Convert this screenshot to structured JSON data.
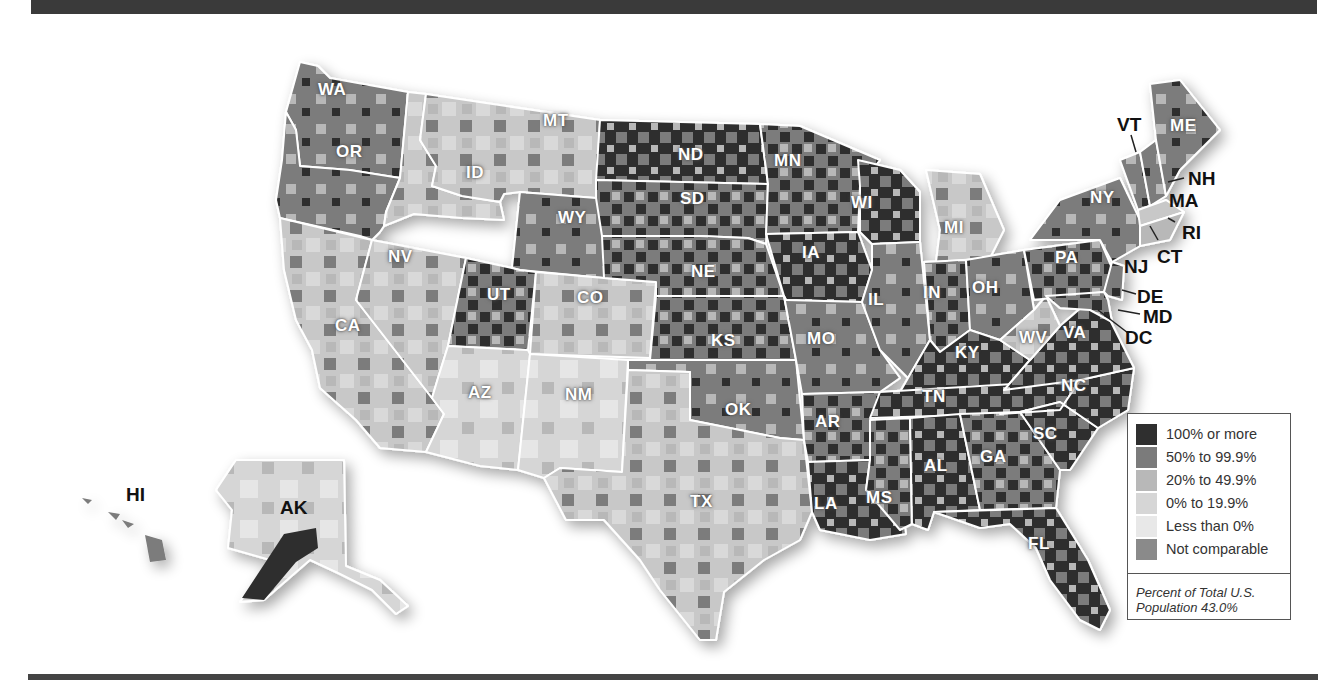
{
  "map": {
    "title": "",
    "subject": "Percent change by county (US)",
    "colors": {
      "c100": "#2f2f2f",
      "c50": "#7b7b7b",
      "c20": "#b8b8b8",
      "c0": "#d6d6d6",
      "neg": "#e8e8e8",
      "nc": "#8a8a8a",
      "border": "#ffffff"
    },
    "state_labels": [
      {
        "id": "WA",
        "text": "WA"
      },
      {
        "id": "OR",
        "text": "OR"
      },
      {
        "id": "CA",
        "text": "CA"
      },
      {
        "id": "ID",
        "text": "ID"
      },
      {
        "id": "NV",
        "text": "NV"
      },
      {
        "id": "MT",
        "text": "MT"
      },
      {
        "id": "WY",
        "text": "WY"
      },
      {
        "id": "UT",
        "text": "UT"
      },
      {
        "id": "AZ",
        "text": "AZ"
      },
      {
        "id": "CO",
        "text": "CO"
      },
      {
        "id": "NM",
        "text": "NM"
      },
      {
        "id": "ND",
        "text": "ND"
      },
      {
        "id": "SD",
        "text": "SD"
      },
      {
        "id": "NE",
        "text": "NE"
      },
      {
        "id": "KS",
        "text": "KS"
      },
      {
        "id": "OK",
        "text": "OK"
      },
      {
        "id": "TX",
        "text": "TX"
      },
      {
        "id": "MN",
        "text": "MN"
      },
      {
        "id": "IA",
        "text": "IA"
      },
      {
        "id": "MO",
        "text": "MO"
      },
      {
        "id": "AR",
        "text": "AR"
      },
      {
        "id": "LA",
        "text": "LA"
      },
      {
        "id": "WI",
        "text": "WI"
      },
      {
        "id": "IL",
        "text": "IL"
      },
      {
        "id": "MS",
        "text": "MS"
      },
      {
        "id": "MI",
        "text": "MI"
      },
      {
        "id": "IN",
        "text": "IN"
      },
      {
        "id": "KY",
        "text": "KY"
      },
      {
        "id": "TN",
        "text": "TN"
      },
      {
        "id": "AL",
        "text": "AL"
      },
      {
        "id": "OH",
        "text": "OH"
      },
      {
        "id": "WV",
        "text": "WV"
      },
      {
        "id": "GA",
        "text": "GA"
      },
      {
        "id": "FL",
        "text": "FL"
      },
      {
        "id": "SC",
        "text": "SC"
      },
      {
        "id": "NC",
        "text": "NC"
      },
      {
        "id": "VA",
        "text": "VA"
      },
      {
        "id": "PA",
        "text": "PA"
      },
      {
        "id": "NY",
        "text": "NY"
      },
      {
        "id": "ME",
        "text": "ME"
      }
    ],
    "callout_labels": [
      {
        "id": "VT",
        "text": "VT"
      },
      {
        "id": "NH",
        "text": "NH"
      },
      {
        "id": "MA",
        "text": "MA"
      },
      {
        "id": "RI",
        "text": "RI"
      },
      {
        "id": "CT",
        "text": "CT"
      },
      {
        "id": "NJ",
        "text": "NJ"
      },
      {
        "id": "DE",
        "text": "DE"
      },
      {
        "id": "MD",
        "text": "MD"
      },
      {
        "id": "DC",
        "text": "DC"
      },
      {
        "id": "HI",
        "text": "HI"
      },
      {
        "id": "AK",
        "text": "AK"
      }
    ]
  },
  "legend": {
    "items": [
      {
        "label": "100% or more",
        "color": "#2f2f2f"
      },
      {
        "label": "50% to 99.9%",
        "color": "#7b7b7b"
      },
      {
        "label": "20% to 49.9%",
        "color": "#b8b8b8"
      },
      {
        "label": "0% to 19.9%",
        "color": "#d6d6d6"
      },
      {
        "label": "Less than 0%",
        "color": "#e8e8e8"
      },
      {
        "label": "Not comparable",
        "color": "#8a8a8a"
      }
    ],
    "note_line1": "Percent of Total U.S.",
    "note_line2": "Population 43.0%"
  }
}
